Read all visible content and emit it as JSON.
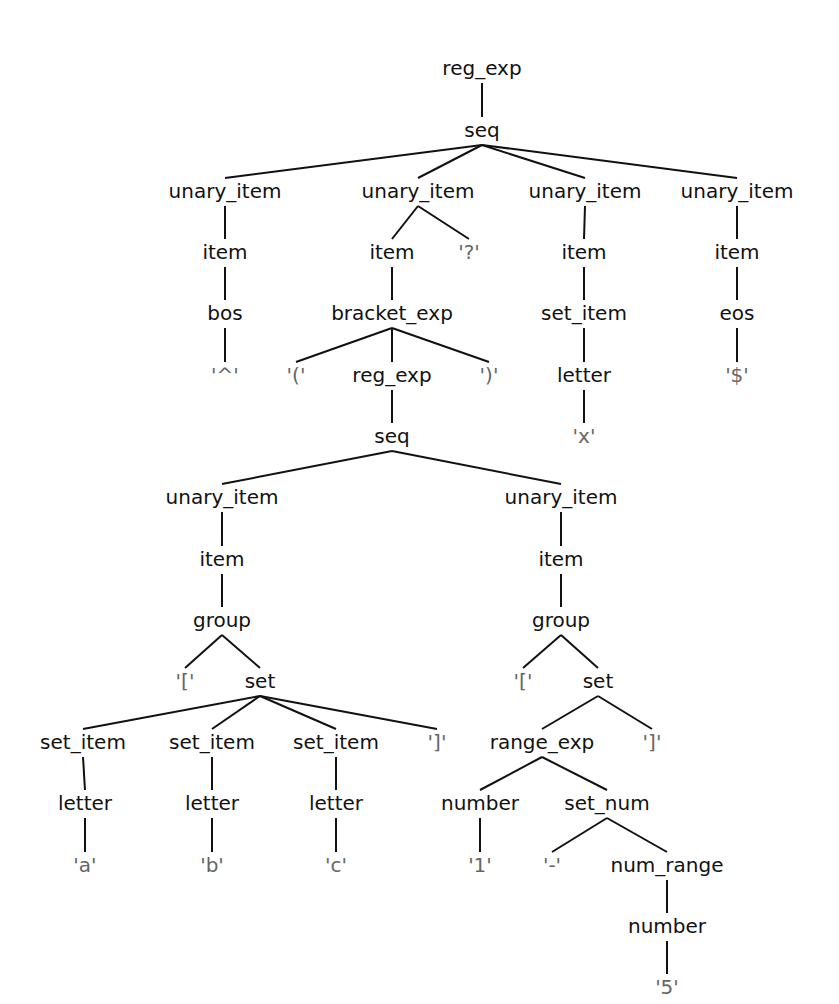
{
  "diagram": {
    "type": "parse-tree",
    "nodes": [
      {
        "id": "n0",
        "label": "reg_exp",
        "x": 482,
        "y": 75,
        "kind": "nonterminal"
      },
      {
        "id": "n1",
        "label": "seq",
        "x": 482,
        "y": 137,
        "kind": "nonterminal"
      },
      {
        "id": "n2",
        "label": "unary_item",
        "x": 225,
        "y": 198,
        "kind": "nonterminal"
      },
      {
        "id": "n3",
        "label": "unary_item",
        "x": 418,
        "y": 198,
        "kind": "nonterminal"
      },
      {
        "id": "n4",
        "label": "unary_item",
        "x": 585,
        "y": 198,
        "kind": "nonterminal"
      },
      {
        "id": "n5",
        "label": "unary_item",
        "x": 737,
        "y": 198,
        "kind": "nonterminal"
      },
      {
        "id": "n6",
        "label": "item",
        "x": 225,
        "y": 259,
        "kind": "nonterminal"
      },
      {
        "id": "n7",
        "label": "item",
        "x": 392,
        "y": 259,
        "kind": "nonterminal"
      },
      {
        "id": "n8",
        "label": "'?'",
        "x": 469,
        "y": 259,
        "kind": "terminal"
      },
      {
        "id": "n9",
        "label": "item",
        "x": 584,
        "y": 259,
        "kind": "nonterminal"
      },
      {
        "id": "n10",
        "label": "item",
        "x": 737,
        "y": 259,
        "kind": "nonterminal"
      },
      {
        "id": "n11",
        "label": "bos",
        "x": 225,
        "y": 320,
        "kind": "nonterminal"
      },
      {
        "id": "n12",
        "label": "bracket_exp",
        "x": 392,
        "y": 320,
        "kind": "nonterminal"
      },
      {
        "id": "n13",
        "label": "set_item",
        "x": 584,
        "y": 320,
        "kind": "nonterminal"
      },
      {
        "id": "n14",
        "label": "eos",
        "x": 737,
        "y": 320,
        "kind": "nonterminal"
      },
      {
        "id": "n15",
        "label": "'^'",
        "x": 225,
        "y": 382,
        "kind": "terminal"
      },
      {
        "id": "n16",
        "label": "'('",
        "x": 296,
        "y": 382,
        "kind": "terminal"
      },
      {
        "id": "n17",
        "label": "reg_exp",
        "x": 392,
        "y": 382,
        "kind": "nonterminal"
      },
      {
        "id": "n18",
        "label": "')'",
        "x": 489,
        "y": 382,
        "kind": "terminal"
      },
      {
        "id": "n19",
        "label": "letter",
        "x": 584,
        "y": 382,
        "kind": "nonterminal"
      },
      {
        "id": "n20",
        "label": "'$'",
        "x": 737,
        "y": 382,
        "kind": "terminal"
      },
      {
        "id": "n21",
        "label": "seq",
        "x": 392,
        "y": 443,
        "kind": "nonterminal"
      },
      {
        "id": "n22",
        "label": "'x'",
        "x": 584,
        "y": 443,
        "kind": "terminal"
      },
      {
        "id": "n23",
        "label": "unary_item",
        "x": 222,
        "y": 504,
        "kind": "nonterminal"
      },
      {
        "id": "n24",
        "label": "unary_item",
        "x": 561,
        "y": 504,
        "kind": "nonterminal"
      },
      {
        "id": "n25",
        "label": "item",
        "x": 222,
        "y": 566,
        "kind": "nonterminal"
      },
      {
        "id": "n26",
        "label": "item",
        "x": 561,
        "y": 566,
        "kind": "nonterminal"
      },
      {
        "id": "n27",
        "label": "group",
        "x": 222,
        "y": 627,
        "kind": "nonterminal"
      },
      {
        "id": "n28",
        "label": "group",
        "x": 561,
        "y": 627,
        "kind": "nonterminal"
      },
      {
        "id": "n29",
        "label": "'['",
        "x": 185,
        "y": 688,
        "kind": "terminal"
      },
      {
        "id": "n30",
        "label": "set",
        "x": 260,
        "y": 688,
        "kind": "nonterminal"
      },
      {
        "id": "n31",
        "label": "'['",
        "x": 523,
        "y": 688,
        "kind": "terminal"
      },
      {
        "id": "n32",
        "label": "set",
        "x": 598,
        "y": 688,
        "kind": "nonterminal"
      },
      {
        "id": "n33",
        "label": "set_item",
        "x": 83,
        "y": 749,
        "kind": "nonterminal"
      },
      {
        "id": "n34",
        "label": "set_item",
        "x": 212,
        "y": 749,
        "kind": "nonterminal"
      },
      {
        "id": "n35",
        "label": "set_item",
        "x": 336,
        "y": 749,
        "kind": "nonterminal"
      },
      {
        "id": "n36",
        "label": "']'",
        "x": 437,
        "y": 749,
        "kind": "terminal"
      },
      {
        "id": "n37",
        "label": "range_exp",
        "x": 542,
        "y": 749,
        "kind": "nonterminal"
      },
      {
        "id": "n38",
        "label": "']'",
        "x": 652,
        "y": 749,
        "kind": "terminal"
      },
      {
        "id": "n39",
        "label": "letter",
        "x": 85,
        "y": 810,
        "kind": "nonterminal"
      },
      {
        "id": "n40",
        "label": "letter",
        "x": 212,
        "y": 810,
        "kind": "nonterminal"
      },
      {
        "id": "n41",
        "label": "letter",
        "x": 336,
        "y": 810,
        "kind": "nonterminal"
      },
      {
        "id": "n42",
        "label": "number",
        "x": 480,
        "y": 810,
        "kind": "nonterminal"
      },
      {
        "id": "n43",
        "label": "set_num",
        "x": 607,
        "y": 810,
        "kind": "nonterminal"
      },
      {
        "id": "n44",
        "label": "'a'",
        "x": 85,
        "y": 872,
        "kind": "terminal"
      },
      {
        "id": "n45",
        "label": "'b'",
        "x": 212,
        "y": 872,
        "kind": "terminal"
      },
      {
        "id": "n46",
        "label": "'c'",
        "x": 336,
        "y": 872,
        "kind": "terminal"
      },
      {
        "id": "n47",
        "label": "'1'",
        "x": 480,
        "y": 872,
        "kind": "terminal"
      },
      {
        "id": "n48",
        "label": "'-'",
        "x": 552,
        "y": 872,
        "kind": "terminal"
      },
      {
        "id": "n49",
        "label": "num_range",
        "x": 667,
        "y": 872,
        "kind": "nonterminal"
      },
      {
        "id": "n50",
        "label": "number",
        "x": 667,
        "y": 933,
        "kind": "nonterminal"
      },
      {
        "id": "n51",
        "label": "'5'",
        "x": 667,
        "y": 994,
        "kind": "terminal"
      }
    ],
    "edges": [
      [
        "n0",
        "n1"
      ],
      [
        "n1",
        "n2"
      ],
      [
        "n1",
        "n3"
      ],
      [
        "n1",
        "n4"
      ],
      [
        "n1",
        "n5"
      ],
      [
        "n2",
        "n6"
      ],
      [
        "n3",
        "n7"
      ],
      [
        "n3",
        "n8"
      ],
      [
        "n4",
        "n9"
      ],
      [
        "n5",
        "n10"
      ],
      [
        "n6",
        "n11"
      ],
      [
        "n7",
        "n12"
      ],
      [
        "n9",
        "n13"
      ],
      [
        "n10",
        "n14"
      ],
      [
        "n11",
        "n15"
      ],
      [
        "n12",
        "n16"
      ],
      [
        "n12",
        "n17"
      ],
      [
        "n12",
        "n18"
      ],
      [
        "n13",
        "n19"
      ],
      [
        "n14",
        "n20"
      ],
      [
        "n17",
        "n21"
      ],
      [
        "n19",
        "n22"
      ],
      [
        "n21",
        "n23"
      ],
      [
        "n21",
        "n24"
      ],
      [
        "n23",
        "n25"
      ],
      [
        "n24",
        "n26"
      ],
      [
        "n25",
        "n27"
      ],
      [
        "n26",
        "n28"
      ],
      [
        "n27",
        "n29"
      ],
      [
        "n27",
        "n30"
      ],
      [
        "n28",
        "n31"
      ],
      [
        "n28",
        "n32"
      ],
      [
        "n30",
        "n33"
      ],
      [
        "n30",
        "n34"
      ],
      [
        "n30",
        "n35"
      ],
      [
        "n30",
        "n36"
      ],
      [
        "n32",
        "n37"
      ],
      [
        "n32",
        "n38"
      ],
      [
        "n33",
        "n39"
      ],
      [
        "n34",
        "n40"
      ],
      [
        "n35",
        "n41"
      ],
      [
        "n37",
        "n42"
      ],
      [
        "n37",
        "n43"
      ],
      [
        "n39",
        "n44"
      ],
      [
        "n40",
        "n45"
      ],
      [
        "n41",
        "n46"
      ],
      [
        "n42",
        "n47"
      ],
      [
        "n43",
        "n48"
      ],
      [
        "n43",
        "n49"
      ],
      [
        "n49",
        "n50"
      ],
      [
        "n50",
        "n51"
      ]
    ],
    "colors": {
      "nonterminal": "#111111",
      "terminal": "#666666",
      "edge": "#111111",
      "background": "#ffffff"
    }
  }
}
